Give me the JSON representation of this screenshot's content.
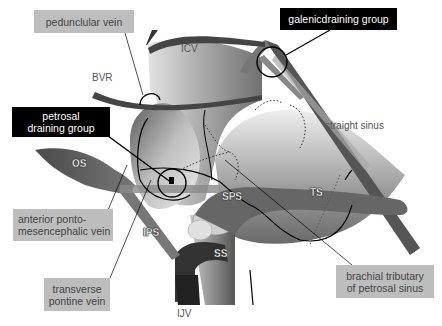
{
  "figure": {
    "callouts": [
      {
        "id": "peduncular-vein",
        "text": "pedunclular vein",
        "style": "gray"
      },
      {
        "id": "galenic-draining-group",
        "text": "galenicdraining group",
        "style": "black"
      },
      {
        "id": "petrosal-draining-group",
        "text": "petrosal draining group",
        "style": "black"
      },
      {
        "id": "anterior-ponto-mesencephalic-vein",
        "text": "anterior ponto-mesencephalic vein",
        "style": "gray"
      },
      {
        "id": "transverse-pontine-vein",
        "text": "transverse pontine vein",
        "style": "gray"
      },
      {
        "id": "brachial-tributary",
        "text": "brachial tributary of petrosal sinus",
        "style": "gray"
      }
    ],
    "labels": {
      "icv": "ICV",
      "bvr": "BVR",
      "straight_sinus": "straight sinus",
      "os": "OS",
      "sps": "SPS",
      "ts": "TS",
      "ips": "IPS",
      "ss": "SS",
      "ijv": "IJV"
    },
    "callout_lines": {
      "peduncular_l1": "petrosal",
      "petrosal_l1": "petrosal",
      "petrosal_l2": "draining group",
      "apm_l1": "anterior ponto-",
      "apm_l2": "mesencephalic vein",
      "tpv_l1": "transverse",
      "tpv_l2": "pontine vein",
      "bt_l1": "brachial tributary",
      "bt_l2": "of petrosal sinus"
    },
    "colors": {
      "vessel_dark": "#3a3a3a",
      "vessel_mid": "#6a6a6a",
      "brainstem_light": "#d8d8d8",
      "callout_gray": "#bdbdbd",
      "callout_black": "#000000"
    }
  }
}
